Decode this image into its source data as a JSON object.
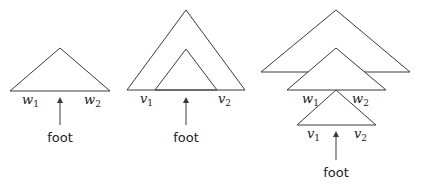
{
  "diagram": {
    "type": "tree-adjunction-illustration",
    "panels": [
      {
        "id": "left",
        "description": "Single auxiliary tree with foot",
        "labels": {
          "left": {
            "base": "w",
            "sub": "1"
          },
          "right": {
            "base": "w",
            "sub": "2"
          },
          "foot": "foot"
        }
      },
      {
        "id": "middle",
        "description": "Nested triangles with foot",
        "labels": {
          "left": {
            "base": "v",
            "sub": "1"
          },
          "right": {
            "base": "v",
            "sub": "2"
          },
          "foot": "foot"
        }
      },
      {
        "id": "right",
        "description": "Stacked trees: outer, middle (w1, w2), bottom (v1, v2) with foot",
        "labels": {
          "mid_left": {
            "base": "w",
            "sub": "1"
          },
          "mid_right": {
            "base": "w",
            "sub": "2"
          },
          "bot_left": {
            "base": "v",
            "sub": "1"
          },
          "bot_right": {
            "base": "v",
            "sub": "2"
          },
          "foot": "foot"
        }
      }
    ],
    "colors": {
      "line": "#3a3a3a",
      "text": "#222222",
      "background": "#ffffff"
    }
  }
}
